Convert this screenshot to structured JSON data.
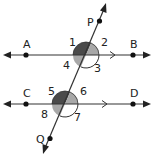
{
  "diagram": {
    "type": "parallel-lines-cut-by-transversal",
    "lines": {
      "top": {
        "label": "AB",
        "points": [
          "A",
          "B"
        ]
      },
      "bottom": {
        "label": "CD",
        "points": [
          "C",
          "D"
        ]
      },
      "transversal": {
        "label": "PQ",
        "points": [
          "P",
          "Q"
        ]
      }
    },
    "point_labels": {
      "A": "A",
      "B": "B",
      "C": "C",
      "D": "D",
      "P": "P",
      "Q": "Q"
    },
    "angle_labels": {
      "a1": "1",
      "a2": "2",
      "a3": "3",
      "a4": "4",
      "a5": "5",
      "a6": "6",
      "a7": "7",
      "a8": "8"
    },
    "colors": {
      "line": "#333333",
      "dark_angle": "#4a4a4a",
      "light_angle": "#a8a8a8",
      "point": "#111111",
      "background": "#ffffff"
    }
  }
}
